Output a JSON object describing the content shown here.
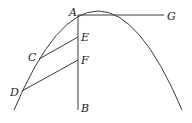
{
  "diagram": {
    "type": "geometry-parabola",
    "labels": {
      "A": "A",
      "B": "B",
      "C": "C",
      "D": "D",
      "E": "E",
      "F": "F",
      "G": "G"
    },
    "stroke_color": "#3a3a3a"
  }
}
